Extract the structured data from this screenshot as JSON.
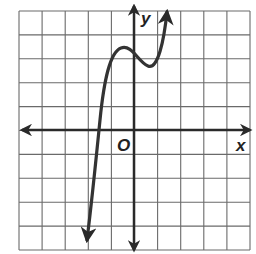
{
  "chart_data": {
    "type": "line",
    "title": "",
    "xlabel": "x",
    "ylabel": "y",
    "origin_label": "O",
    "grid": true,
    "xlim": [
      -5,
      5
    ],
    "ylim": [
      -5,
      5
    ],
    "grid_step": 1,
    "tick_labels_shown": false,
    "series": [
      {
        "name": "cubic curve",
        "description": "Cubic polynomial with local max near (-0.6, 3.5) and local min near (0.6, 2.7); crosses x-axis near x = -1.6; falls to -infinity on left, rises to +infinity on right",
        "points": [
          {
            "x": -2.0,
            "y": -4.7
          },
          {
            "x": -1.8,
            "y": -2.5
          },
          {
            "x": -1.6,
            "y": 0.0
          },
          {
            "x": -1.3,
            "y": 2.0
          },
          {
            "x": -1.0,
            "y": 3.1
          },
          {
            "x": -0.6,
            "y": 3.5
          },
          {
            "x": -0.2,
            "y": 3.3
          },
          {
            "x": 0.2,
            "y": 2.9
          },
          {
            "x": 0.6,
            "y": 2.7
          },
          {
            "x": 1.0,
            "y": 3.1
          },
          {
            "x": 1.3,
            "y": 4.2
          },
          {
            "x": 1.4,
            "y": 5.0
          }
        ]
      }
    ]
  },
  "labels": {
    "x_axis": "x",
    "y_axis": "y",
    "origin": "O"
  },
  "colors": {
    "grid": "#6a6a6a",
    "axes": "#2a2a2a",
    "curve": "#333333",
    "background": "#ffffff"
  }
}
